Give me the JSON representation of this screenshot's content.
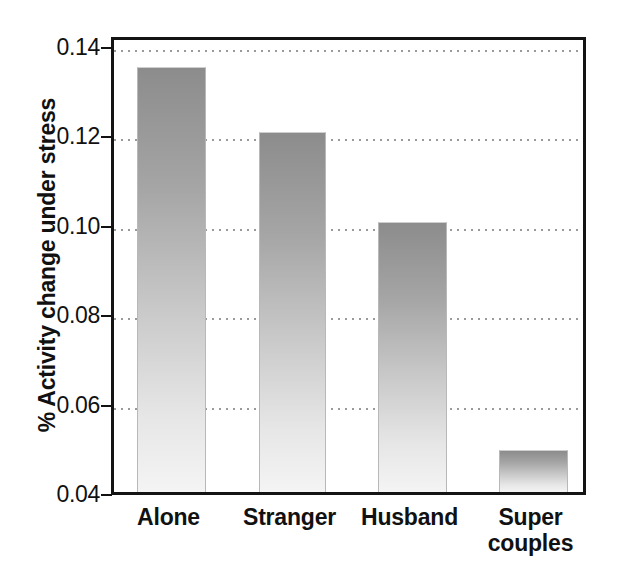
{
  "chart_data": {
    "type": "bar",
    "title": "",
    "subtitle": "",
    "xlabel": "",
    "ylabel": "% Activity change under stress",
    "categories": [
      "Alone",
      "Stranger",
      "Husband",
      "Super couples"
    ],
    "values": [
      0.135,
      0.1205,
      0.1005,
      0.0495
    ],
    "ylim": [
      0.04,
      0.14
    ],
    "ytick_values": [
      0.04,
      0.06,
      0.08,
      0.1,
      0.12,
      0.14
    ],
    "ytick_labels": [
      "0.04",
      "0.06",
      "0.08",
      "0.10",
      "0.12",
      "0.14"
    ],
    "grid": true,
    "grid_axis": "y",
    "grid_style": "dotted",
    "legend": null,
    "legend_position": "none",
    "bar_fill": "vertical-gradient-gray",
    "bar_color_top": "#8c8c8c",
    "bar_color_bottom": "#f4f4f4",
    "frame_color": "#141414",
    "text_color": "#111111",
    "background": "#ffffff"
  },
  "axis": {
    "y_title": "% Activity change under stress",
    "ticks": [
      {
        "label": "0.14",
        "value": 0.14
      },
      {
        "label": "0.12",
        "value": 0.12
      },
      {
        "label": "0.10",
        "value": 0.1
      },
      {
        "label": "0.08",
        "value": 0.08
      },
      {
        "label": "0.06",
        "value": 0.06
      },
      {
        "label": "0.04",
        "value": 0.04
      }
    ]
  },
  "categories": [
    {
      "label": "Alone",
      "line1": "Alone",
      "line2": "",
      "value": 0.135
    },
    {
      "label": "Stranger",
      "line1": "Stranger",
      "line2": "",
      "value": 0.1205
    },
    {
      "label": "Husband",
      "line1": "Husband",
      "line2": "",
      "value": 0.1005
    },
    {
      "label": "Super couples",
      "line1": "Super",
      "line2": "couples",
      "value": 0.0495
    }
  ]
}
